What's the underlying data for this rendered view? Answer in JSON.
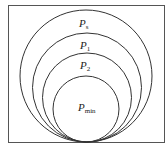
{
  "diagram": {
    "type": "nested-tangent-circles",
    "frame": {
      "x": 8,
      "y": 5,
      "width": 156,
      "height": 137,
      "stroke": "#555555"
    },
    "tangent_point": {
      "x": 86,
      "y": 142
    },
    "circles": [
      {
        "label_base": "P",
        "label_sub": "s",
        "cx": 86,
        "cy": 76,
        "r": 66,
        "label_x": 79,
        "label_y": 27
      },
      {
        "label_base": "P",
        "label_sub": "1",
        "cx": 87,
        "cy": 87.5,
        "r": 54.5,
        "label_x": 80,
        "label_y": 49
      },
      {
        "label_base": "P",
        "label_sub": "2",
        "cx": 87,
        "cy": 97.5,
        "r": 44.5,
        "label_x": 80,
        "label_y": 69
      },
      {
        "label_base": "P",
        "label_sub": "min",
        "cx": 86,
        "cy": 109,
        "r": 33,
        "label_x": 78,
        "label_y": 111
      }
    ],
    "stroke": "#333333"
  }
}
